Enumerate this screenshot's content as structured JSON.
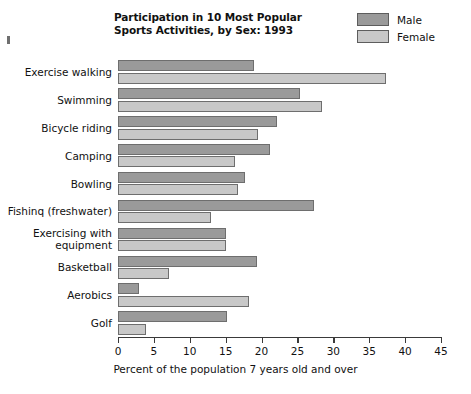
{
  "chart_data": {
    "type": "bar",
    "orientation": "horizontal",
    "title": "Participation in 10 Most Popular\nSports Activities, by Sex: 1993",
    "xlabel": "Percent of the population 7 years old and over",
    "ylabel": "",
    "xlim": [
      0,
      45
    ],
    "xticks": [
      0,
      5,
      10,
      15,
      20,
      25,
      30,
      35,
      40,
      45
    ],
    "grid": false,
    "legend_position": "top-right",
    "categories": [
      "Exercise walking",
      "Swimming",
      "Bicycle riding",
      "Camping",
      "Bowling",
      "Fishinq (freshwater)",
      "Exercising with\nequipment",
      "Basketball",
      "Aerobics",
      "Golf"
    ],
    "series": [
      {
        "name": "Male",
        "color": "#9a9a9a",
        "values": [
          19.0,
          25.3,
          22.1,
          21.2,
          17.7,
          27.3,
          15.0,
          19.3,
          2.9,
          15.2
        ]
      },
      {
        "name": "Female",
        "color": "#c8c8c8",
        "values": [
          37.3,
          28.4,
          19.5,
          16.3,
          16.7,
          13.0,
          15.0,
          7.1,
          18.2,
          3.9
        ]
      }
    ]
  },
  "legend": {
    "items": [
      {
        "label": "Male",
        "color": "#9a9a9a"
      },
      {
        "label": "Female",
        "color": "#c8c8c8"
      }
    ]
  }
}
